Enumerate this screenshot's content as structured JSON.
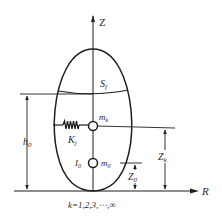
{
  "diagram": {
    "type": "sloshing-tank-equivalent-mechanical-model",
    "axes": {
      "vertical_label": "Z",
      "horizontal_label": "R"
    },
    "labels": {
      "free_surface": "S",
      "free_surface_sub": "f",
      "liquid_height": "h",
      "liquid_height_sub": "0",
      "spring": "K",
      "spring_sub": "j",
      "sloshing_mass": "m",
      "sloshing_mass_sub": "k",
      "fixed_mass": "m",
      "fixed_mass_sub": "0",
      "inertia": "I",
      "inertia_sub": "0",
      "sloshing_mass_height": "Z",
      "sloshing_mass_height_sub": "k",
      "fixed_mass_height": "Z",
      "fixed_mass_height_sub": "0",
      "mode_index": "k=1,2,3,⋯,∞"
    },
    "colors": {
      "line": "#1e1e1e",
      "text": "#2a2a2a",
      "background": "#ffffff"
    }
  }
}
